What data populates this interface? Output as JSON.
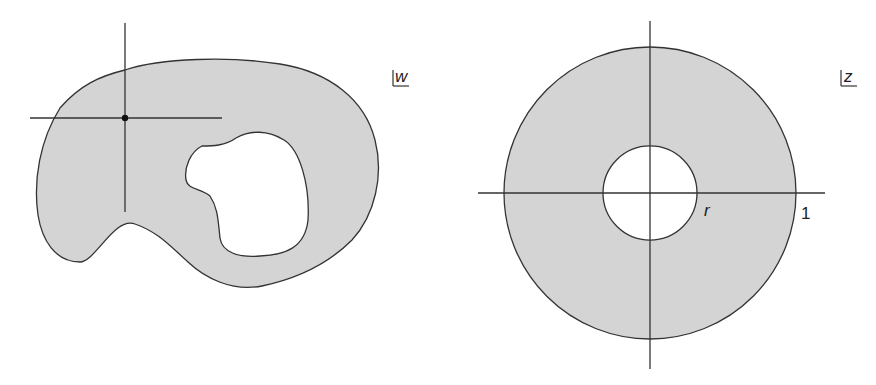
{
  "figure": {
    "left_panel": {
      "plane_label": "w",
      "description": "doubly connected region with irregular outer boundary and irregular hole, crosshair at interior point",
      "fill_color": "#d4d4d4",
      "stroke_color": "#333333"
    },
    "right_panel": {
      "plane_label": "z",
      "description": "annulus r < |z| < 1 with coordinate axes",
      "inner_radius_label": "r",
      "outer_radius_label": "1",
      "fill_color": "#d4d4d4",
      "stroke_color": "#333333"
    }
  }
}
